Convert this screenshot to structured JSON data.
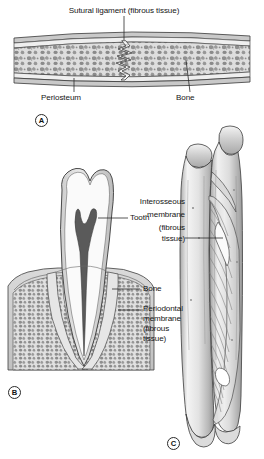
{
  "figure": {
    "background_color": "#ffffff",
    "ink_color": "#161616"
  },
  "panels": [
    {
      "id": "A",
      "badge": "A",
      "name": "suture-of-skull",
      "labels": [
        {
          "name": "sutural-ligament",
          "text": "Sutural ligament (fibrous tissue)"
        },
        {
          "name": "periosteum",
          "text": "Periosteum"
        },
        {
          "name": "bone",
          "text": "Bone"
        }
      ]
    },
    {
      "id": "B",
      "badge": "B",
      "name": "tooth-in-socket-gomphosis",
      "labels": [
        {
          "name": "tooth",
          "text": "Tooth"
        },
        {
          "name": "bone",
          "text": "Bone"
        },
        {
          "name": "periodontal-membrane",
          "text": "Periodontal\nmembrane\n(fibrous\ntissue)"
        }
      ]
    },
    {
      "id": "C",
      "badge": "C",
      "name": "radius-and-ulna-syndesmosis",
      "labels": [
        {
          "name": "interosseous-membrane",
          "text": "Interosseous\nmembrane\n(fibrous\ntissue)"
        }
      ]
    }
  ],
  "labels": {
    "sutural_ligament": "Sutural ligament (fibrous tissue)",
    "periosteum": "Periosteum",
    "bone_a": "Bone",
    "tooth": "Tooth",
    "bone_b": "Bone",
    "periodontal_l1": "Periodontal",
    "periodontal_l2": "membrane",
    "periodontal_l3": "(fibrous",
    "periodontal_l4": "tissue)",
    "interosseous_l1": "Interosseous",
    "interosseous_l2": "membrane",
    "interosseous_l3": "(fibrous",
    "interosseous_l4": "tissue)",
    "badge_a": "A",
    "badge_b": "B",
    "badge_c": "C"
  },
  "colors": {
    "outline": "#3a3a3a",
    "bone_cortical": "#dcdcdc",
    "bone_trabecular_fill": "#d8d8d8",
    "trabecula": "#8c8c8c",
    "periosteum": "#c6c6c6",
    "enamel": "#d3d3d3",
    "dentin": "#f2f2f2",
    "pulp": "#595959",
    "gum": "#cfcfcf",
    "ligament": "#ededed",
    "shaft_light": "#efefef",
    "shaft_mid": "#c9c9c9",
    "shaft_dark": "#a0a0a0",
    "membrane": "#bdbdbd"
  }
}
